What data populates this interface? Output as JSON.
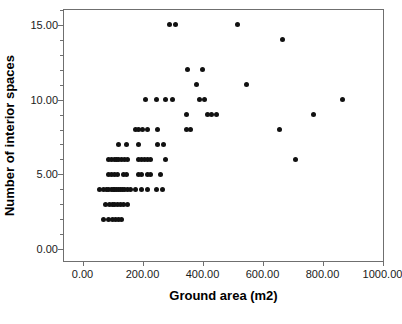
{
  "chart_data": {
    "type": "scatter",
    "title": "",
    "xlabel": "Ground area (m2)",
    "ylabel": "Number of interior spaces",
    "xlim": [
      -65,
      1005
    ],
    "ylim": [
      -0.85,
      16.05
    ],
    "grid": false,
    "legend": null,
    "xticks": [
      0,
      200,
      400,
      600,
      800,
      1000
    ],
    "xtick_labels": [
      "0.00",
      "200.00",
      "400.00",
      "600.00",
      "800.00",
      "1000.00"
    ],
    "yticks": [
      0,
      5,
      10,
      15
    ],
    "ytick_labels": [
      "0.00",
      "5.00",
      "10.00",
      "15.00"
    ],
    "yminor_ticks": [
      1,
      2,
      3,
      4,
      6,
      7,
      8,
      9,
      11,
      12,
      13,
      14,
      16
    ],
    "marker": "filled-circle",
    "marker_color": "#111111",
    "marker_size_px": 5,
    "frame_color": "#6f6f6f",
    "background": "#ffffff",
    "n_points": 97,
    "x": [
      70,
      85,
      100,
      110,
      120,
      130,
      75,
      90,
      100,
      108,
      115,
      125,
      135,
      150,
      55,
      70,
      80,
      88,
      95,
      102,
      108,
      114,
      120,
      126,
      132,
      140,
      150,
      160,
      175,
      195,
      215,
      245,
      265,
      85,
      95,
      105,
      115,
      135,
      145,
      185,
      195,
      215,
      225,
      260,
      85,
      95,
      105,
      112,
      120,
      130,
      140,
      150,
      185,
      195,
      205,
      215,
      225,
      275,
      120,
      145,
      185,
      250,
      270,
      175,
      185,
      200,
      215,
      250,
      345,
      360,
      345,
      415,
      430,
      445,
      770,
      210,
      245,
      275,
      300,
      390,
      405,
      865,
      380,
      545,
      350,
      400,
      665,
      290,
      310,
      515,
      655,
      710
    ],
    "y": [
      2,
      2,
      2,
      2,
      2,
      2,
      3,
      3,
      3,
      3,
      3,
      3,
      3,
      3,
      4,
      4,
      4,
      4,
      4,
      4,
      4,
      4,
      4,
      4,
      4,
      4,
      4,
      4,
      4,
      4,
      4,
      4,
      4,
      5,
      5,
      5,
      5,
      5,
      5,
      5,
      5,
      5,
      5,
      5,
      6,
      6,
      6,
      6,
      6,
      6,
      6,
      6,
      6,
      6,
      6,
      6,
      6,
      6,
      7,
      7,
      7,
      7,
      7,
      8,
      8,
      8,
      8,
      8,
      8,
      8,
      9,
      9,
      9,
      9,
      9,
      10,
      10,
      10,
      10,
      10,
      10,
      10,
      11,
      11,
      12,
      12,
      14,
      15,
      15,
      15,
      8,
      6
    ]
  },
  "axis": {
    "x_title": "Ground area (m2)",
    "y_title": "Number of interior spaces"
  }
}
